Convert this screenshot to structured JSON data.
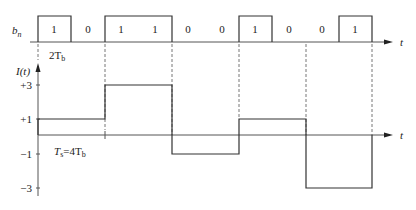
{
  "figure": {
    "type": "diagram",
    "bit_row": {
      "label": "b",
      "label_sub": "n",
      "bits": [
        "1",
        "0",
        "1",
        "1",
        "0",
        "0",
        "1",
        "0",
        "0",
        "1"
      ],
      "axis_label": "t",
      "bit_period_label": "2T",
      "bit_period_sub": "b"
    },
    "waveform": {
      "y_label": "I(t)",
      "x_label": "t",
      "y_ticks": [
        "+3",
        "+1",
        "−1",
        "−3"
      ],
      "symbol_period_label": "T",
      "symbol_period_sub": "s",
      "symbol_period_eq": "=4T",
      "symbol_period_eq_sub": "b",
      "symbols": [
        {
          "bits": "10",
          "level": 1
        },
        {
          "bits": "11",
          "level": 3
        },
        {
          "bits": "00",
          "level": -1
        },
        {
          "bits": "10",
          "level": 1
        },
        {
          "bits": "01",
          "level": -3
        }
      ]
    }
  }
}
